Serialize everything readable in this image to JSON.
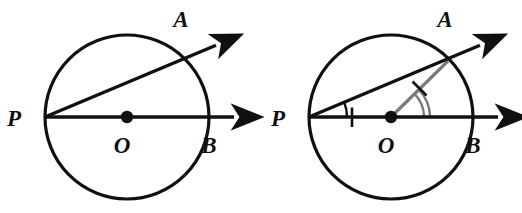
{
  "figure": {
    "background_color": "#ffffff",
    "stroke_color": "#101010",
    "accent_color": "#7a7a7a",
    "diagrams": [
      {
        "id": "left-diagram",
        "name": "unmarked-circle-diagram",
        "circle": {
          "cx": 127,
          "cy": 117,
          "r": 82
        },
        "center_point": {
          "x": 127,
          "y": 117,
          "label": "O",
          "label_x": 122,
          "label_y": 152
        },
        "points": [
          {
            "name": "P",
            "label": "P",
            "x": 45,
            "y": 117,
            "label_x": 14,
            "label_y": 126
          },
          {
            "name": "A",
            "label": "A",
            "x": 185,
            "y": 60,
            "label_x": 181,
            "label_y": 27
          },
          {
            "name": "B",
            "label": "B",
            "x": 209,
            "y": 117,
            "label_x": 208,
            "label_y": 152
          }
        ],
        "rays": [
          {
            "name": "ray-PB",
            "from": "P",
            "to": "B",
            "x1": 45,
            "y1": 117,
            "x2": 238,
            "y2": 117
          },
          {
            "name": "ray-PA",
            "from": "P",
            "to": "A",
            "x1": 45,
            "y1": 117,
            "x2": 219,
            "y2": 44
          }
        ],
        "marks": {
          "angle_arc_at_p": false,
          "angle_arc_at_o": false,
          "tick_on_po": false,
          "tick_on_oa": false,
          "radius_oa": false
        }
      },
      {
        "id": "right-diagram",
        "name": "marked-circle-diagram",
        "circle": {
          "cx": 391,
          "cy": 117,
          "r": 82
        },
        "center_point": {
          "x": 391,
          "y": 117,
          "label": "O",
          "label_x": 386,
          "label_y": 152
        },
        "points": [
          {
            "name": "P",
            "label": "P",
            "x": 309,
            "y": 117,
            "label_x": 278,
            "label_y": 126
          },
          {
            "name": "A",
            "label": "A",
            "x": 449,
            "y": 60,
            "label_x": 445,
            "label_y": 27
          },
          {
            "name": "B",
            "label": "B",
            "x": 473,
            "y": 117,
            "label_x": 472,
            "label_y": 152
          }
        ],
        "rays": [
          {
            "name": "ray-PB",
            "from": "P",
            "to": "B",
            "x1": 309,
            "y1": 117,
            "x2": 502,
            "y2": 117
          },
          {
            "name": "ray-PA",
            "from": "P",
            "to": "A",
            "x1": 309,
            "y1": 117,
            "x2": 483,
            "y2": 44
          }
        ],
        "marks": {
          "angle_arc_at_p": true,
          "angle_arc_at_p_count": 1,
          "angle_arc_at_o": true,
          "angle_arc_at_o_count": 2,
          "tick_on_po": true,
          "tick_on_po_count": 1,
          "tick_on_oa": true,
          "tick_on_oa_count": 1,
          "radius_oa": true
        }
      }
    ]
  }
}
